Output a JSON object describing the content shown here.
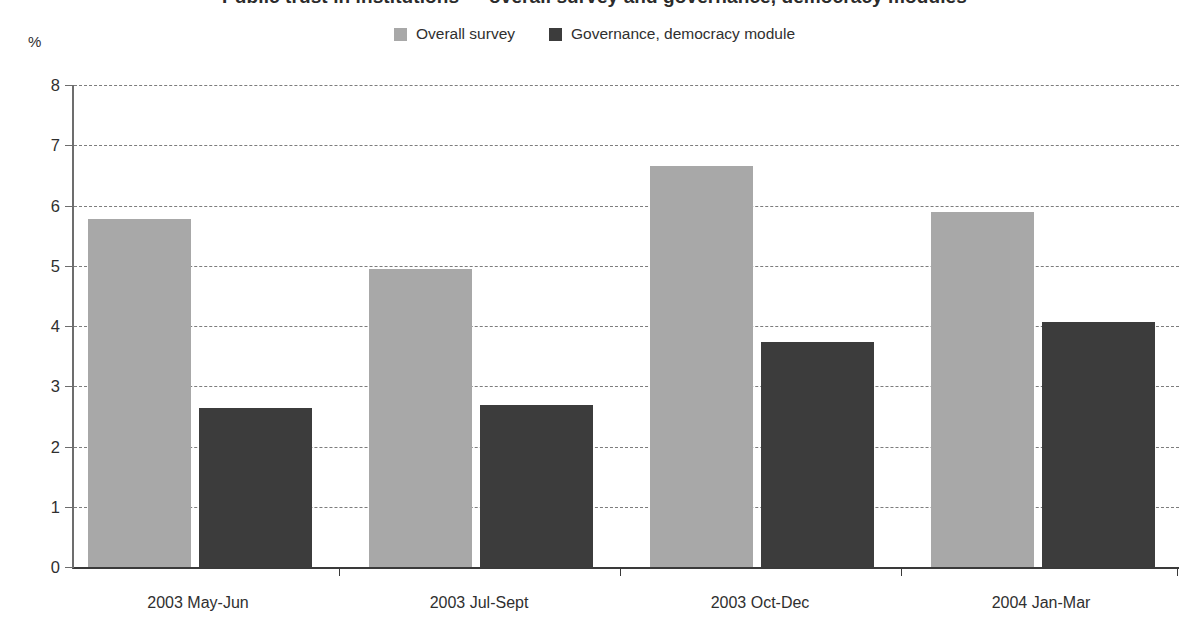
{
  "title": "Public trust in institutions — overall survey and governance, democracy modules",
  "axis": {
    "unit_label": "%",
    "y_ticks": [
      "0",
      "1",
      "2",
      "3",
      "4",
      "5",
      "6",
      "7",
      "8"
    ],
    "ylim": [
      0,
      8
    ],
    "grid": "horizontal dashed"
  },
  "legend": {
    "position": "top-center",
    "items": [
      {
        "label": "Overall survey",
        "color": "#a8a8a8",
        "swatch": "legend-swatch-overall"
      },
      {
        "label": "Governance, democracy module",
        "color": "#3c3c3c",
        "swatch": "legend-swatch-module"
      }
    ]
  },
  "categories": [
    "2003 May-Jun",
    "2003 Jul-Sept",
    "2003 Oct-Dec",
    "2004 Jan-Mar"
  ],
  "chart_data": {
    "type": "bar",
    "title": "Public trust in institutions — overall survey and governance, democracy modules",
    "xlabel": "",
    "ylabel": "%",
    "ylim": [
      0,
      8
    ],
    "yticks": [
      0,
      1,
      2,
      3,
      4,
      5,
      6,
      7,
      8
    ],
    "grid": true,
    "legend_position": "top-center",
    "categories": [
      "2003 May-Jun",
      "2003 Jul-Sept",
      "2003 Oct-Dec",
      "2004 Jan-Mar"
    ],
    "series": [
      {
        "name": "Overall survey",
        "color": "#a8a8a8",
        "values": [
          5.78,
          4.94,
          6.65,
          5.9
        ]
      },
      {
        "name": "Governance, democracy module",
        "color": "#3c3c3c",
        "values": [
          2.64,
          2.69,
          3.73,
          4.07
        ]
      }
    ]
  }
}
